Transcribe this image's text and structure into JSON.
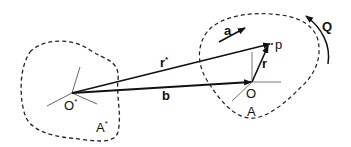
{
  "diagram": {
    "type": "vector-geometry",
    "regions": [
      {
        "id": "A_star",
        "label": "A",
        "superscript": "*",
        "style": "dashed"
      },
      {
        "id": "A",
        "label": "A",
        "superscript": "",
        "style": "dashed"
      }
    ],
    "points": [
      {
        "id": "O_star",
        "label": "O",
        "superscript": "*"
      },
      {
        "id": "O",
        "label": "O"
      },
      {
        "id": "p",
        "label": "p"
      }
    ],
    "vectors": [
      {
        "id": "r_star",
        "label": "r",
        "superscript": "*",
        "from": "O*",
        "to": "p"
      },
      {
        "id": "b",
        "label": "b",
        "from": "O*",
        "to": "O"
      },
      {
        "id": "r",
        "label": "r",
        "from": "O",
        "to": "p"
      },
      {
        "id": "a",
        "label": "a",
        "note": "free direction arrow inside region A"
      }
    ],
    "rotation": {
      "label": "Q",
      "direction": "counter-clockwise arc"
    },
    "colors": {
      "stroke": "#111111",
      "axis": "#555555",
      "background": "#ffffff"
    }
  }
}
